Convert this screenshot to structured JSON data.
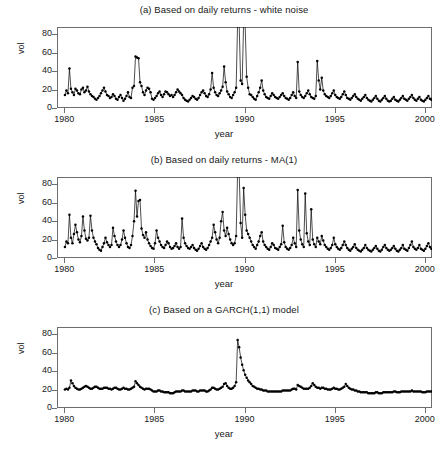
{
  "figure": {
    "width": 448,
    "height": 451,
    "background": "#ffffff",
    "line_color": "#000000",
    "point_color": "#000000",
    "frame_color": "#6e6e6e"
  },
  "axis": {
    "xlabel": "year",
    "ylabel": "vol",
    "xticks": [
      "1980",
      "1985",
      "1990",
      "1995",
      "2000"
    ],
    "xtick_values": [
      1980,
      1985,
      1990,
      1995,
      2000
    ],
    "yticks": [
      "0",
      "20",
      "40",
      "60",
      "80"
    ],
    "ytick_values": [
      0,
      20,
      40,
      60,
      80
    ],
    "xlim": [
      1979.6,
      2000.4
    ],
    "ylim": [
      0,
      88
    ],
    "grid": false,
    "legend": "none"
  },
  "chart_data": [
    {
      "id": "panel-a",
      "type": "line",
      "title": "(a) Based on daily returns - white noise",
      "xlabel": "year",
      "ylabel": "vol",
      "xlim": [
        1979.6,
        2000.4
      ],
      "ylim": [
        0,
        88
      ],
      "clipped_above": true,
      "marker": "filled-circle",
      "x_start": 1980.04,
      "x_step": 0.0833,
      "values": [
        14,
        19,
        16,
        43,
        21,
        17,
        14,
        21,
        19,
        16,
        15,
        20,
        22,
        17,
        19,
        23,
        18,
        15,
        13,
        12,
        10,
        9,
        11,
        13,
        16,
        19,
        22,
        18,
        14,
        13,
        11,
        12,
        15,
        13,
        10,
        9,
        12,
        14,
        11,
        8,
        10,
        13,
        17,
        12,
        11,
        22,
        24,
        56,
        55,
        54,
        28,
        24,
        17,
        14,
        19,
        22,
        21,
        17,
        10,
        9,
        11,
        13,
        16,
        18,
        14,
        12,
        15,
        18,
        17,
        15,
        13,
        14,
        12,
        14,
        17,
        20,
        18,
        16,
        14,
        11,
        9,
        8,
        7,
        9,
        11,
        13,
        12,
        10,
        9,
        11,
        14,
        17,
        19,
        16,
        13,
        12,
        15,
        20,
        38,
        22,
        17,
        14,
        13,
        16,
        19,
        23,
        45,
        28,
        18,
        15,
        12,
        11,
        14,
        17,
        22,
        95,
        92,
        30,
        26,
        95,
        90,
        34,
        22,
        15,
        14,
        12,
        10,
        9,
        13,
        17,
        22,
        30,
        19,
        15,
        12,
        11,
        10,
        13,
        16,
        14,
        12,
        11,
        10,
        12,
        14,
        16,
        13,
        11,
        10,
        9,
        11,
        14,
        17,
        13,
        11,
        50,
        18,
        14,
        12,
        11,
        13,
        16,
        19,
        15,
        12,
        11,
        10,
        13,
        51,
        30,
        20,
        33,
        19,
        15,
        13,
        12,
        11,
        13,
        16,
        19,
        14,
        12,
        11,
        10,
        12,
        15,
        18,
        14,
        11,
        10,
        9,
        11,
        13,
        15,
        12,
        10,
        9,
        8,
        10,
        12,
        14,
        11,
        9,
        8,
        7,
        9,
        11,
        13,
        10,
        8,
        7,
        9,
        11,
        13,
        10,
        8,
        7,
        8,
        10,
        12,
        9,
        8,
        7,
        9,
        11,
        13,
        10,
        9,
        8,
        10,
        12,
        14,
        11,
        9,
        8,
        10,
        12,
        9,
        8,
        7,
        9,
        11,
        13,
        10,
        9,
        11,
        14,
        17,
        13,
        11,
        14,
        18,
        15,
        13,
        16,
        20,
        24,
        18,
        16,
        14,
        17,
        21,
        25,
        20,
        18,
        22,
        26,
        30,
        24,
        20,
        18,
        67,
        28,
        24,
        20,
        18,
        16,
        14,
        12,
        10,
        9,
        13,
        18,
        24,
        85,
        84,
        49,
        28,
        24,
        20,
        30,
        30,
        27,
        22,
        17,
        14,
        13,
        16,
        20,
        45,
        30,
        22,
        17,
        13,
        12
      ]
    },
    {
      "id": "panel-b",
      "type": "line",
      "title": "(b) Based on daily returns - MA(1)",
      "xlabel": "year",
      "ylabel": "vol",
      "xlim": [
        1979.6,
        2000.4
      ],
      "ylim": [
        0,
        88
      ],
      "clipped_above": true,
      "marker": "filled-circle",
      "x_start": 1980.04,
      "x_step": 0.0833,
      "values": [
        12,
        18,
        16,
        47,
        22,
        16,
        26,
        36,
        28,
        20,
        17,
        24,
        45,
        30,
        21,
        19,
        22,
        46,
        30,
        22,
        18,
        15,
        11,
        9,
        8,
        12,
        16,
        22,
        17,
        14,
        12,
        14,
        33,
        24,
        18,
        14,
        12,
        14,
        20,
        30,
        22,
        16,
        12,
        11,
        14,
        24,
        40,
        73,
        45,
        62,
        63,
        32,
        25,
        22,
        28,
        20,
        16,
        13,
        11,
        10,
        16,
        30,
        22,
        18,
        14,
        12,
        11,
        14,
        18,
        16,
        12,
        10,
        11,
        13,
        16,
        12,
        10,
        12,
        43,
        22,
        16,
        13,
        11,
        10,
        12,
        14,
        11,
        9,
        8,
        10,
        13,
        16,
        12,
        10,
        9,
        11,
        14,
        18,
        22,
        36,
        28,
        20,
        16,
        22,
        40,
        50,
        30,
        24,
        33,
        26,
        20,
        16,
        14,
        16,
        24,
        95,
        94,
        38,
        22,
        76,
        47,
        30,
        26,
        22,
        18,
        14,
        12,
        10,
        14,
        18,
        24,
        28,
        18,
        14,
        12,
        10,
        9,
        12,
        16,
        14,
        11,
        10,
        9,
        12,
        15,
        35,
        17,
        12,
        10,
        9,
        11,
        14,
        22,
        16,
        12,
        74,
        30,
        20,
        15,
        12,
        70,
        27,
        18,
        14,
        53,
        20,
        15,
        12,
        22,
        18,
        15,
        24,
        19,
        14,
        12,
        10,
        9,
        11,
        14,
        22,
        15,
        12,
        10,
        9,
        11,
        14,
        18,
        14,
        11,
        9,
        8,
        10,
        12,
        15,
        11,
        9,
        8,
        7,
        9,
        11,
        14,
        11,
        9,
        8,
        7,
        9,
        11,
        13,
        10,
        8,
        7,
        9,
        12,
        14,
        11,
        9,
        8,
        9,
        11,
        13,
        10,
        8,
        7,
        9,
        11,
        14,
        10,
        9,
        8,
        11,
        14,
        18,
        12,
        10,
        9,
        11,
        14,
        10,
        9,
        8,
        10,
        13,
        16,
        12,
        10,
        13,
        18,
        22,
        16,
        13,
        18,
        24,
        20,
        16,
        20,
        26,
        30,
        22,
        18,
        16,
        20,
        26,
        34,
        26,
        22,
        28,
        33,
        30,
        26,
        22,
        19,
        30,
        26,
        22,
        18,
        16,
        14,
        12,
        10,
        8,
        6,
        14,
        24,
        36,
        95,
        92,
        45,
        61,
        30,
        24,
        38,
        40,
        36,
        28,
        22,
        18,
        9,
        22,
        30,
        61,
        40,
        30,
        22,
        16,
        13
      ]
    },
    {
      "id": "panel-c",
      "type": "line",
      "title": "(c) Based on a GARCH(1,1) model",
      "xlabel": "year",
      "ylabel": "vol",
      "xlim": [
        1979.6,
        2000.4
      ],
      "ylim": [
        0,
        88
      ],
      "clipped_above": false,
      "marker": "filled-circle",
      "x_start": 1980.04,
      "x_step": 0.0833,
      "values": [
        20,
        21,
        20,
        22,
        30,
        27,
        24,
        22,
        21,
        20,
        20,
        21,
        22,
        23,
        24,
        23,
        22,
        21,
        21,
        22,
        23,
        23,
        22,
        21,
        21,
        21,
        22,
        22,
        22,
        21,
        21,
        20,
        21,
        22,
        22,
        21,
        20,
        20,
        21,
        22,
        21,
        21,
        20,
        20,
        21,
        22,
        23,
        29,
        27,
        25,
        23,
        22,
        21,
        20,
        21,
        21,
        21,
        20,
        19,
        18,
        18,
        18,
        19,
        19,
        18,
        18,
        17,
        17,
        17,
        17,
        16,
        16,
        16,
        17,
        18,
        18,
        18,
        18,
        19,
        19,
        18,
        18,
        18,
        18,
        18,
        19,
        19,
        19,
        18,
        18,
        19,
        19,
        19,
        19,
        18,
        18,
        19,
        20,
        22,
        22,
        21,
        20,
        20,
        21,
        22,
        23,
        26,
        27,
        24,
        22,
        21,
        21,
        22,
        24,
        28,
        74,
        66,
        55,
        47,
        41,
        36,
        33,
        30,
        28,
        26,
        24,
        23,
        22,
        21,
        21,
        20,
        20,
        19,
        19,
        19,
        18,
        18,
        18,
        18,
        18,
        18,
        18,
        18,
        18,
        18,
        19,
        19,
        19,
        19,
        19,
        19,
        20,
        21,
        21,
        20,
        25,
        24,
        23,
        22,
        21,
        21,
        21,
        21,
        22,
        24,
        27,
        25,
        23,
        22,
        22,
        21,
        22,
        22,
        21,
        21,
        20,
        20,
        20,
        21,
        22,
        21,
        21,
        20,
        20,
        21,
        22,
        23,
        26,
        24,
        22,
        21,
        20,
        20,
        19,
        19,
        18,
        18,
        17,
        17,
        17,
        17,
        17,
        16,
        16,
        16,
        16,
        16,
        17,
        17,
        16,
        16,
        16,
        17,
        17,
        17,
        17,
        17,
        17,
        17,
        18,
        18,
        17,
        17,
        17,
        18,
        18,
        18,
        18,
        18,
        18,
        18,
        19,
        18,
        18,
        18,
        18,
        18,
        18,
        17,
        17,
        17,
        18,
        18,
        18,
        18,
        18,
        18,
        18,
        18,
        17,
        17,
        18,
        18,
        18,
        18,
        19,
        19,
        19,
        19,
        19,
        20,
        21,
        22,
        22,
        23,
        24,
        25,
        26,
        25,
        24,
        23,
        25,
        24,
        23,
        22,
        21,
        20,
        19,
        19,
        18,
        18,
        18,
        19,
        21,
        40,
        31,
        28,
        26,
        25,
        24,
        24,
        24,
        24,
        23,
        22,
        21,
        21,
        20,
        20,
        20,
        20,
        20,
        20,
        20,
        20
      ]
    }
  ]
}
